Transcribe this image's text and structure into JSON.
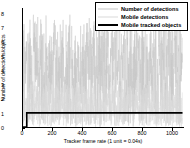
{
  "chart_data": {
    "type": "line",
    "title": "",
    "xlabel": "Tracker frame rate (1 unit = 0.04s)",
    "ylabel": "Number of detections/objects",
    "xlim": [
      0,
      1080
    ],
    "ylim": [
      0,
      8.4
    ],
    "xticks": [
      0,
      200,
      400,
      600,
      800,
      1000
    ],
    "yticks": [
      0,
      1,
      2,
      3,
      4,
      5,
      6,
      7,
      8
    ],
    "grid": false,
    "legend_position": "top-right",
    "series": [
      {
        "name": "Number of detections",
        "color": "#c8c8c8",
        "style": "dense-noise",
        "note": "Highly oscillating trace spanning 0 to 8, densest between 0 and 7",
        "x": [
          0,
          10,
          20,
          30,
          40,
          50,
          60,
          70,
          80,
          90,
          100,
          110,
          120,
          130,
          140,
          150,
          160,
          170,
          180,
          190,
          200,
          210,
          220,
          230,
          240,
          250,
          260,
          270,
          280,
          290,
          300,
          310,
          320,
          330,
          340,
          350,
          360,
          370,
          380,
          390,
          400,
          410,
          420,
          430,
          440,
          450,
          460,
          470,
          480,
          490,
          500,
          510,
          520,
          530,
          540,
          550,
          560,
          570,
          580,
          590,
          600,
          610,
          620,
          630,
          640,
          650,
          660,
          670,
          680,
          690,
          700,
          710,
          720,
          730,
          740,
          750,
          760,
          770,
          780,
          790,
          800,
          810,
          820,
          830,
          840,
          850,
          860,
          870,
          880,
          890,
          900,
          910,
          920,
          930,
          940,
          950,
          960,
          970,
          980,
          990,
          1000,
          1010,
          1020,
          1030,
          1040,
          1050,
          1060,
          1070
        ],
        "values": [
          0,
          3,
          6,
          2,
          7,
          4,
          1,
          5,
          8,
          3,
          6,
          2,
          5,
          7,
          1,
          4,
          6,
          3,
          7,
          2,
          5,
          8,
          4,
          1,
          6,
          3,
          7,
          5,
          2,
          6,
          4,
          8,
          1,
          5,
          3,
          7,
          2,
          6,
          4,
          1,
          7,
          3,
          5,
          8,
          2,
          6,
          4,
          7,
          1,
          5,
          3,
          8,
          6,
          2,
          7,
          4,
          1,
          6,
          3,
          5,
          8,
          2,
          7,
          4,
          6,
          1,
          5,
          3,
          7,
          2,
          6,
          4,
          8,
          1,
          5,
          7,
          3,
          6,
          2,
          4,
          8,
          5,
          1,
          7,
          3,
          6,
          2,
          5,
          4,
          8,
          1,
          6,
          3,
          7,
          5,
          2,
          4,
          6,
          8,
          3,
          1,
          5,
          7,
          2,
          6,
          4,
          3,
          5
        ]
      },
      {
        "name": "Mobile detections",
        "color": "#d9d9d9",
        "style": "dense-noise",
        "note": "Oscillating trace concentrated between 0 and 3",
        "x": [
          0,
          10,
          20,
          30,
          40,
          50,
          60,
          70,
          80,
          90,
          100,
          110,
          120,
          130,
          140,
          150,
          160,
          170,
          180,
          190,
          200,
          210,
          220,
          230,
          240,
          250,
          260,
          270,
          280,
          290,
          300,
          310,
          320,
          330,
          340,
          350,
          360,
          370,
          380,
          390,
          400,
          410,
          420,
          430,
          440,
          450,
          460,
          470,
          480,
          490,
          500,
          510,
          520,
          530,
          540,
          550,
          560,
          570,
          580,
          590,
          600,
          610,
          620,
          630,
          640,
          650,
          660,
          670,
          680,
          690,
          700,
          710,
          720,
          730,
          740,
          750,
          760,
          770,
          780,
          790,
          800,
          810,
          820,
          830,
          840,
          850,
          860,
          870,
          880,
          890,
          900,
          910,
          920,
          930,
          940,
          950,
          960,
          970,
          980,
          990,
          1000,
          1010,
          1020,
          1030,
          1040,
          1050,
          1060,
          1070
        ],
        "values": [
          0,
          1,
          2,
          0,
          3,
          1,
          2,
          0,
          1,
          3,
          2,
          0,
          1,
          2,
          3,
          0,
          2,
          1,
          3,
          0,
          1,
          2,
          0,
          3,
          1,
          2,
          3,
          0,
          1,
          2,
          0,
          3,
          1,
          0,
          2,
          1,
          3,
          0,
          2,
          1,
          0,
          3,
          2,
          1,
          0,
          2,
          3,
          1,
          0,
          2,
          1,
          3,
          0,
          1,
          2,
          0,
          3,
          1,
          2,
          0,
          1,
          3,
          2,
          0,
          1,
          2,
          3,
          0,
          1,
          2,
          0,
          3,
          1,
          2,
          0,
          1,
          3,
          2,
          0,
          1,
          2,
          0,
          3,
          1,
          2,
          0,
          1,
          2,
          3,
          0,
          1,
          2,
          0,
          3,
          1,
          2,
          0,
          1,
          3,
          2,
          0,
          1,
          2,
          0,
          1,
          2,
          1,
          0
        ]
      },
      {
        "name": "Mobile tracked objects",
        "color": "#000000",
        "style": "step",
        "note": "Steps from 0 to 1 near x=25 and stays constant at 1",
        "x": [
          0,
          22,
          25,
          1070
        ],
        "values": [
          0,
          0,
          1,
          1
        ]
      }
    ]
  },
  "legend": {
    "items": [
      {
        "label": "Number of detections",
        "color": "#c8c8c8",
        "thickness": 1
      },
      {
        "label": "Mobile detections",
        "color": "#d9d9d9",
        "thickness": 1
      },
      {
        "label": "Mobile tracked objects",
        "color": "#000000",
        "thickness": 2
      }
    ]
  },
  "axes": {
    "y_label": "Number of detections/objects",
    "x_label": "Tracker frame rate (1 unit = 0.04s)",
    "y_tick_labels": [
      "0",
      "1",
      "2",
      "3",
      "4",
      "5",
      "6",
      "7",
      "8"
    ],
    "x_tick_labels": [
      "0",
      "200",
      "400",
      "600",
      "800",
      "1000"
    ]
  },
  "colors": {
    "axis": "#000000",
    "background": "#ffffff",
    "noise_light": "#d9d9d9",
    "noise_mid": "#c8c8c8",
    "tracked": "#000000"
  }
}
